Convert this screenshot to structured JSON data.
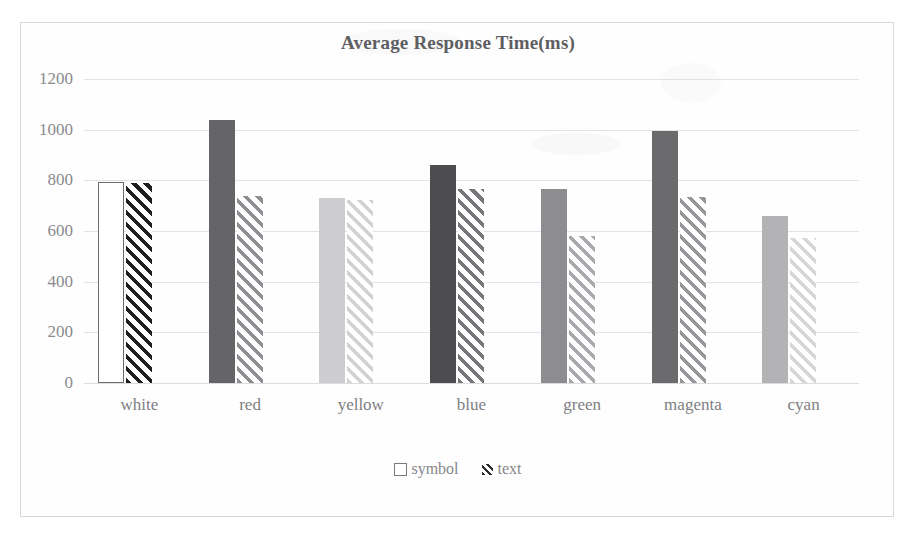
{
  "chart_data": {
    "type": "bar",
    "title": "Average Response Time(ms)",
    "xlabel": "",
    "ylabel": "",
    "ylim": [
      0,
      1200
    ],
    "yticks": [
      0,
      200,
      400,
      600,
      800,
      1000,
      1200
    ],
    "grid": true,
    "legend_position": "bottom",
    "categories": [
      "white",
      "red",
      "yellow",
      "blue",
      "green",
      "magenta",
      "cyan"
    ],
    "series": [
      {
        "name": "symbol",
        "pattern": "solid",
        "values": [
          795,
          1040,
          730,
          862,
          765,
          995,
          658
        ],
        "colors": [
          "#ffffff",
          "#656568",
          "#cdcdcf",
          "#4d4d50",
          "#8d8d91",
          "#6b6b6e",
          "#b3b3b6"
        ],
        "border_colors": [
          "#6e6e72",
          "#656568",
          "#cdcdcf",
          "#4d4d50",
          "#8d8d91",
          "#6b6b6e",
          "#b3b3b6"
        ]
      },
      {
        "name": "text",
        "pattern": "diagonal-hatch",
        "values": [
          788,
          740,
          722,
          765,
          580,
          735,
          572
        ],
        "colors": [
          "#1f1f1f",
          "#8f8f93",
          "#d2d2d4",
          "#77777b",
          "#a9a9ad",
          "#97979b",
          "#d6d6d8"
        ]
      }
    ]
  },
  "legend": {
    "items": [
      {
        "label": "symbol",
        "marker": "open-square-marker"
      },
      {
        "label": "text",
        "marker": "hatched-square-marker"
      }
    ]
  },
  "axis": {
    "y_tick_labels": [
      "1200",
      "1000",
      "800",
      "600",
      "400",
      "200",
      "0"
    ],
    "x_tick_labels": [
      "white",
      "red",
      "yellow",
      "blue",
      "green",
      "magenta",
      "cyan"
    ]
  },
  "colors": {
    "title": "#5e5e62",
    "tick_label": "#8a8a8e",
    "gridline": "#e3e3e5",
    "frame_border": "#d8d8da",
    "background": "#ffffff"
  }
}
